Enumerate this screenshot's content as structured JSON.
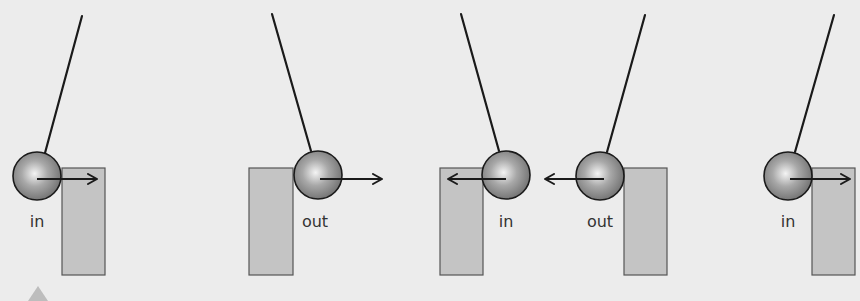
{
  "canvas": {
    "width": 860,
    "height": 301,
    "background": "#ececec"
  },
  "colors": {
    "line": "#1a1a1a",
    "block_fill": "#c4c4c4",
    "block_stroke": "#555555",
    "ball_light": "#f4f4f4",
    "ball_mid": "#a8a8a8",
    "ball_dark": "#6e6e6e",
    "label": "#333333",
    "marker": "#bdbdbd"
  },
  "panels": [
    {
      "id": "panel-1",
      "string": {
        "x1": 82,
        "y1": 16,
        "x2": 45,
        "y2": 153
      },
      "ball": {
        "cx": 37,
        "cy": 176,
        "r": 24
      },
      "block": {
        "x": 62,
        "y": 168,
        "w": 43,
        "h": 107
      },
      "arrow": {
        "x1": 37,
        "y1": 179,
        "x2": 97,
        "y2": 179,
        "dir": "right"
      },
      "label": {
        "text": "in",
        "x": 37,
        "y": 227
      }
    },
    {
      "id": "panel-2",
      "string": {
        "x1": 272,
        "y1": 14,
        "x2": 311,
        "y2": 151
      },
      "ball": {
        "cx": 318,
        "cy": 175,
        "r": 24
      },
      "block": {
        "x": 249,
        "y": 168,
        "w": 44,
        "h": 107
      },
      "arrow": {
        "x1": 320,
        "y1": 179,
        "x2": 382,
        "y2": 179,
        "dir": "right"
      },
      "label": {
        "text": "out",
        "x": 315,
        "y": 227
      }
    },
    {
      "id": "panel-3",
      "string": {
        "x1": 461,
        "y1": 14,
        "x2": 499,
        "y2": 151
      },
      "ball": {
        "cx": 506,
        "cy": 175,
        "r": 24
      },
      "block": {
        "x": 440,
        "y": 168,
        "w": 43,
        "h": 107
      },
      "arrow": {
        "x1": 506,
        "y1": 179,
        "x2": 448,
        "y2": 179,
        "dir": "left"
      },
      "label": {
        "text": "in",
        "x": 506,
        "y": 227
      }
    },
    {
      "id": "panel-4",
      "string": {
        "x1": 645,
        "y1": 15,
        "x2": 607,
        "y2": 152
      },
      "ball": {
        "cx": 600,
        "cy": 176,
        "r": 24
      },
      "block": {
        "x": 624,
        "y": 168,
        "w": 43,
        "h": 107
      },
      "arrow": {
        "x1": 604,
        "y1": 179,
        "x2": 545,
        "y2": 179,
        "dir": "left"
      },
      "label": {
        "text": "out",
        "x": 600,
        "y": 227
      }
    },
    {
      "id": "panel-5",
      "string": {
        "x1": 834,
        "y1": 15,
        "x2": 795,
        "y2": 152
      },
      "ball": {
        "cx": 788,
        "cy": 176,
        "r": 24
      },
      "block": {
        "x": 812,
        "y": 168,
        "w": 43,
        "h": 107
      },
      "arrow": {
        "x1": 790,
        "y1": 179,
        "x2": 850,
        "y2": 179,
        "dir": "right"
      },
      "label": {
        "text": "in",
        "x": 788,
        "y": 227
      }
    }
  ],
  "corner_marker": {
    "points": "38,286 48,301 28,301"
  }
}
